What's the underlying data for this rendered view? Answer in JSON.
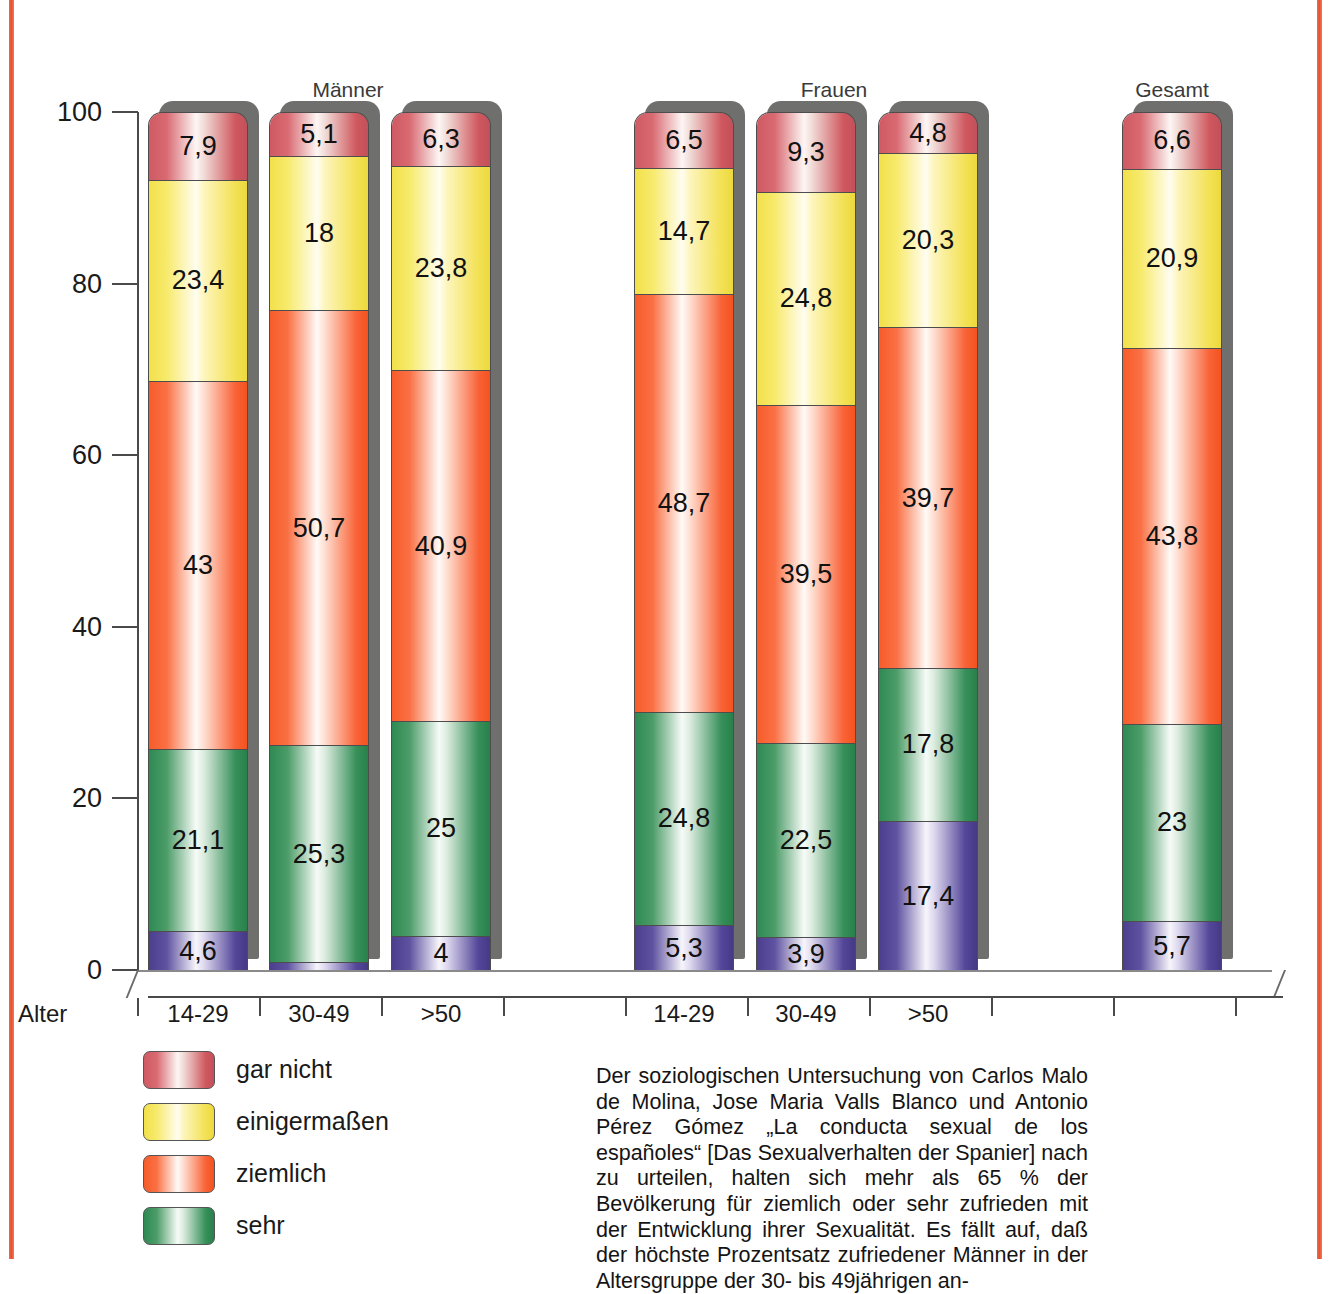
{
  "chart_data": {
    "type": "bar",
    "subtype": "stacked-column-100",
    "title": "",
    "xlabel": "Alter",
    "ylabel": "",
    "ylim": [
      0,
      100
    ],
    "yticks": [
      "0",
      "20",
      "40",
      "60",
      "80",
      "100"
    ],
    "grid": false,
    "legend_position": "bottom-left",
    "group_labels": [
      "Männer",
      "Frauen",
      "Gesamt"
    ],
    "categories": [
      "14-29",
      "30-49",
      ">50",
      "14-29",
      "30-49",
      ">50",
      ""
    ],
    "legend": [
      {
        "label": "gar nicht",
        "color": "#d45b64",
        "key": "garnicht"
      },
      {
        "label": "einigermaßen",
        "color": "#f5e257",
        "key": "einigermassen"
      },
      {
        "label": "ziemlich",
        "color": "#f8602e",
        "key": "ziemlich"
      },
      {
        "label": "sehr",
        "color": "#328c55",
        "key": "sehr"
      }
    ],
    "series": [
      {
        "name": "gar nicht",
        "values": [
          7.9,
          5.1,
          6.3,
          6.5,
          9.3,
          4.8,
          6.6
        ]
      },
      {
        "name": "einigermaßen",
        "values": [
          23.4,
          18,
          23.8,
          14.7,
          24.8,
          20.3,
          20.9
        ]
      },
      {
        "name": "ziemlich",
        "values": [
          43,
          50.7,
          40.9,
          48.7,
          39.5,
          39.7,
          43.8
        ]
      },
      {
        "name": "sehr",
        "values": [
          21.1,
          25.3,
          25,
          24.8,
          22.5,
          17.8,
          23
        ]
      },
      {
        "name": "ohne Angabe",
        "values": [
          4.6,
          0.9,
          4,
          5.3,
          3.9,
          17.4,
          5.7
        ]
      }
    ],
    "bars": [
      {
        "group": "Männer",
        "category": "14-29",
        "x": 148,
        "segments": [
          {
            "key": "garnicht",
            "value": 7.9,
            "label": "7,9"
          },
          {
            "key": "einigermassen",
            "value": 23.4,
            "label": "23,4"
          },
          {
            "key": "ziemlich",
            "value": 43,
            "label": "43"
          },
          {
            "key": "sehr",
            "value": 21.1,
            "label": "21,1"
          },
          {
            "key": "purple",
            "value": 4.6,
            "label": "4,6"
          }
        ]
      },
      {
        "group": "Männer",
        "category": "30-49",
        "x": 269,
        "segments": [
          {
            "key": "garnicht",
            "value": 5.1,
            "label": "5,1"
          },
          {
            "key": "einigermassen",
            "value": 18,
            "label": "18"
          },
          {
            "key": "ziemlich",
            "value": 50.7,
            "label": "50,7"
          },
          {
            "key": "sehr",
            "value": 25.3,
            "label": "25,3"
          },
          {
            "key": "purple",
            "value": 0.9,
            "label": ""
          }
        ]
      },
      {
        "group": "Männer",
        "category": ">50",
        "x": 391,
        "segments": [
          {
            "key": "garnicht",
            "value": 6.3,
            "label": "6,3"
          },
          {
            "key": "einigermassen",
            "value": 23.8,
            "label": "23,8"
          },
          {
            "key": "ziemlich",
            "value": 40.9,
            "label": "40,9"
          },
          {
            "key": "sehr",
            "value": 25,
            "label": "25"
          },
          {
            "key": "purple",
            "value": 4,
            "label": "4"
          }
        ]
      },
      {
        "group": "Frauen",
        "category": "14-29",
        "x": 634,
        "segments": [
          {
            "key": "garnicht",
            "value": 6.5,
            "label": "6,5"
          },
          {
            "key": "einigermassen",
            "value": 14.7,
            "label": "14,7"
          },
          {
            "key": "ziemlich",
            "value": 48.7,
            "label": "48,7"
          },
          {
            "key": "sehr",
            "value": 24.8,
            "label": "24,8"
          },
          {
            "key": "purple",
            "value": 5.3,
            "label": "5,3"
          }
        ]
      },
      {
        "group": "Frauen",
        "category": "30-49",
        "x": 756,
        "segments": [
          {
            "key": "garnicht",
            "value": 9.3,
            "label": "9,3"
          },
          {
            "key": "einigermassen",
            "value": 24.8,
            "label": "24,8"
          },
          {
            "key": "ziemlich",
            "value": 39.5,
            "label": "39,5"
          },
          {
            "key": "sehr",
            "value": 22.5,
            "label": "22,5"
          },
          {
            "key": "purple",
            "value": 3.9,
            "label": "3,9"
          }
        ]
      },
      {
        "group": "Frauen",
        "category": ">50",
        "x": 878,
        "segments": [
          {
            "key": "garnicht",
            "value": 4.8,
            "label": "4,8"
          },
          {
            "key": "einigermassen",
            "value": 20.3,
            "label": "20,3"
          },
          {
            "key": "ziemlich",
            "value": 39.7,
            "label": "39,7"
          },
          {
            "key": "sehr",
            "value": 17.8,
            "label": "17,8"
          },
          {
            "key": "purple",
            "value": 17.4,
            "label": "17,4"
          }
        ]
      },
      {
        "group": "Gesamt",
        "category": "",
        "x": 1122,
        "segments": [
          {
            "key": "garnicht",
            "value": 6.6,
            "label": "6,6"
          },
          {
            "key": "einigermassen",
            "value": 20.9,
            "label": "20,9"
          },
          {
            "key": "ziemlich",
            "value": 43.8,
            "label": "43,8"
          },
          {
            "key": "sehr",
            "value": 23,
            "label": "23"
          },
          {
            "key": "purple",
            "value": 5.7,
            "label": "5,7"
          }
        ]
      }
    ],
    "group_title_positions": [
      {
        "label": "Männer",
        "x": 198,
        "width": 300
      },
      {
        "label": "Frauen",
        "x": 684,
        "width": 300
      },
      {
        "label": "Gesamt",
        "x": 1022,
        "width": 300
      }
    ],
    "x_tick_positions": [
      137,
      259,
      381,
      503,
      625,
      747,
      869,
      991,
      1113,
      1235
    ],
    "cat_label_positions": [
      {
        "label": "14-29",
        "x": 148
      },
      {
        "label": "30-49",
        "x": 269
      },
      {
        "label": ">50",
        "x": 391
      },
      {
        "label": "14-29",
        "x": 634
      },
      {
        "label": "30-49",
        "x": 756
      },
      {
        "label": ">50",
        "x": 878
      }
    ]
  },
  "axis": {
    "x_name": "Alter"
  },
  "caption": {
    "text": "Der soziologischen Untersuchung von Carlos Malo de Molina, Jose Maria Valls Blanco und Antonio Pérez Gómez „La conducta sexual de los españoles“ [Das Sexualverhalten der Spanier] nach zu urteilen, halten sich mehr als 65 % der Bevölkerung für ziemlich oder sehr zufrieden mit der Entwicklung ihrer Sexualität. Es fällt auf, daß der höchste Prozentsatz zufriedener Männer in der Altersgruppe der 30- bis 49jährigen an-"
  },
  "colors": {
    "frame": "#ef5f3a",
    "axis": "#4a4a4a",
    "shadow": "#6f6f6d"
  }
}
